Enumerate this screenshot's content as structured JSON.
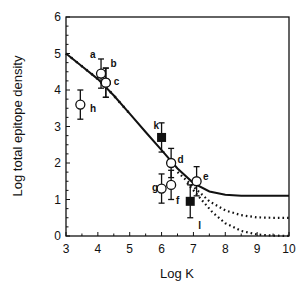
{
  "chart_data": {
    "type": "scatter",
    "title": "",
    "xlabel": "Log K",
    "ylabel": "Log total epitope density",
    "xlim": [
      3,
      10
    ],
    "ylim": [
      0,
      6
    ],
    "xticks": [
      "3",
      "4",
      "5",
      "6",
      "7",
      "8",
      "9",
      "10"
    ],
    "yticks": [
      "0",
      "1",
      "2",
      "3",
      "4",
      "5",
      "6"
    ],
    "grid": false,
    "points": [
      {
        "label": "a",
        "x": 4.1,
        "y": 4.45,
        "err": 0.4,
        "marker": "open-circle"
      },
      {
        "label": "b",
        "x": 4.25,
        "y": 4.2,
        "err": 0.4,
        "marker": "open-circle"
      },
      {
        "label": "c",
        "x": 4.25,
        "y": 4.2,
        "err": 0.4,
        "marker": "open-circle"
      },
      {
        "label": "h",
        "x": 3.45,
        "y": 3.6,
        "err": 0.4,
        "marker": "open-circle"
      },
      {
        "label": "k",
        "x": 6.0,
        "y": 2.7,
        "err": 0.4,
        "marker": "filled-square"
      },
      {
        "label": "d",
        "x": 6.3,
        "y": 2.0,
        "err": 0.4,
        "marker": "open-circle"
      },
      {
        "label": "g",
        "x": 6.0,
        "y": 1.3,
        "err": 0.4,
        "marker": "open-circle"
      },
      {
        "label": "f",
        "x": 6.3,
        "y": 1.4,
        "err": 0.4,
        "marker": "open-circle"
      },
      {
        "label": "e",
        "x": 7.1,
        "y": 1.5,
        "err": 0.4,
        "marker": "open-circle"
      },
      {
        "label": "l",
        "x": 6.9,
        "y": 0.95,
        "err": 0.45,
        "marker": "filled-square"
      }
    ],
    "point_label_offsets": {
      "a": [
        -0.35,
        0.55
      ],
      "b": [
        0.15,
        0.55
      ],
      "c": [
        0.25,
        0.05
      ],
      "h": [
        0.3,
        -0.1
      ],
      "k": [
        -0.25,
        0.35
      ],
      "d": [
        0.2,
        0.1
      ],
      "g": [
        -0.3,
        0.05
      ],
      "f": [
        0.15,
        -0.4
      ],
      "e": [
        0.2,
        0.15
      ],
      "l": [
        0.25,
        -0.65
      ]
    },
    "series": [
      {
        "name": "model-solid",
        "style": "solid",
        "x": [
          3.0,
          3.5,
          4.0,
          4.5,
          5.0,
          5.5,
          6.0,
          6.5,
          7.0,
          7.5,
          8.0,
          8.5,
          9.0,
          10.0
        ],
        "y": [
          5.0,
          4.65,
          4.3,
          3.85,
          3.35,
          2.85,
          2.35,
          1.85,
          1.45,
          1.22,
          1.13,
          1.1,
          1.1,
          1.1
        ]
      },
      {
        "name": "model-dotted-mid",
        "style": "dotted",
        "x": [
          6.5,
          7.0,
          7.5,
          8.0,
          8.5,
          9.0,
          9.5,
          10.0
        ],
        "y": [
          1.75,
          1.35,
          0.95,
          0.7,
          0.57,
          0.51,
          0.5,
          0.5
        ]
      },
      {
        "name": "model-dotted-low",
        "style": "dotted",
        "x": [
          6.8,
          7.2,
          7.6,
          8.0,
          8.5,
          9.0,
          9.5,
          10.0
        ],
        "y": [
          1.45,
          1.05,
          0.65,
          0.35,
          0.14,
          0.04,
          0.01,
          0.0
        ]
      },
      {
        "name": "model-ticked",
        "style": "ticked",
        "x": [
          3.0,
          3.5,
          4.0,
          4.5,
          5.0
        ],
        "y": [
          5.0,
          4.65,
          4.3,
          3.85,
          3.35
        ]
      }
    ]
  }
}
